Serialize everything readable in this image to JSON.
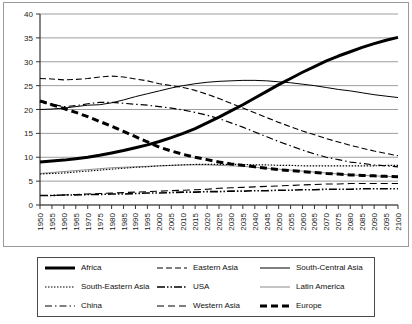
{
  "chart_data": {
    "type": "line",
    "title": "",
    "xlabel": "",
    "ylabel": "",
    "xlim": [
      1950,
      2100
    ],
    "ylim": [
      0,
      40
    ],
    "ytick_step": 5,
    "xtick_step": 5,
    "grid": true,
    "legend_position": "below",
    "yticks": [
      "0",
      "5",
      "10",
      "15",
      "20",
      "25",
      "30",
      "35",
      "40"
    ],
    "x": [
      1950,
      1955,
      1960,
      1965,
      1970,
      1975,
      1980,
      1985,
      1990,
      1995,
      2000,
      2005,
      2010,
      2015,
      2020,
      2025,
      2030,
      2035,
      2040,
      2045,
      2050,
      2055,
      2060,
      2065,
      2070,
      2075,
      2080,
      2085,
      2090,
      2095,
      2100
    ],
    "xtick_labels": [
      "1950",
      "1955",
      "1960",
      "1965",
      "1970",
      "1975",
      "1980",
      "1985",
      "1990",
      "1995",
      "2000",
      "2005",
      "2010",
      "2015",
      "2020",
      "2025",
      "2030",
      "2035",
      "2040",
      "2045",
      "2050",
      "2055",
      "2060",
      "2065",
      "2070",
      "2075",
      "2080",
      "2085",
      "2090",
      "2095",
      "2100"
    ],
    "series": [
      {
        "name": "Africa",
        "style": "solid-thick",
        "color": "#000000",
        "values": [
          9.0,
          9.2,
          9.4,
          9.7,
          10.0,
          10.4,
          10.9,
          11.4,
          12.0,
          12.6,
          13.3,
          14.1,
          15.0,
          16.0,
          17.2,
          18.4,
          19.7,
          21.0,
          22.4,
          23.8,
          25.2,
          26.5,
          27.8,
          29.0,
          30.2,
          31.2,
          32.1,
          33.0,
          33.8,
          34.5,
          35.1
        ]
      },
      {
        "name": "Eastern Asia",
        "style": "dashed",
        "color": "#000000",
        "values": [
          26.5,
          26.4,
          26.2,
          26.3,
          26.5,
          26.8,
          27.0,
          26.8,
          26.4,
          26.0,
          25.4,
          25.0,
          24.6,
          24.0,
          23.2,
          22.3,
          21.3,
          20.3,
          19.3,
          18.3,
          17.3,
          16.4,
          15.5,
          14.7,
          13.9,
          13.2,
          12.5,
          11.9,
          11.3,
          10.8,
          10.3
        ]
      },
      {
        "name": "South-Central Asia",
        "style": "solid-thin",
        "color": "#000000",
        "values": [
          20.0,
          20.1,
          20.3,
          20.6,
          20.9,
          21.0,
          21.4,
          22.0,
          22.7,
          23.3,
          23.9,
          24.5,
          25.0,
          25.4,
          25.7,
          25.9,
          26.0,
          26.1,
          26.1,
          26.0,
          25.8,
          25.6,
          25.3,
          25.0,
          24.6,
          24.2,
          23.9,
          23.5,
          23.1,
          22.8,
          22.5
        ]
      },
      {
        "name": "South-Eastern Asia",
        "style": "dotted",
        "color": "#000000",
        "values": [
          6.5,
          6.6,
          6.7,
          6.9,
          7.1,
          7.3,
          7.5,
          7.7,
          7.9,
          8.0,
          8.2,
          8.3,
          8.4,
          8.5,
          8.5,
          8.5,
          8.5,
          8.5,
          8.4,
          8.4,
          8.3,
          8.3,
          8.2,
          8.2,
          8.2,
          8.2,
          8.2,
          8.2,
          8.2,
          8.3,
          8.3
        ]
      },
      {
        "name": "USA",
        "style": "dash-dot-dot",
        "color": "#000000",
        "values": [
          2.0,
          2.0,
          2.1,
          2.1,
          2.2,
          2.2,
          2.3,
          2.3,
          2.4,
          2.5,
          2.5,
          2.6,
          2.7,
          2.7,
          2.8,
          2.8,
          2.9,
          2.9,
          3.0,
          3.0,
          3.1,
          3.1,
          3.2,
          3.2,
          3.3,
          3.3,
          3.3,
          3.4,
          3.4,
          3.4,
          3.4
        ]
      },
      {
        "name": "Latin America",
        "style": "solid-light",
        "color": "#8a8a8a",
        "values": [
          6.6,
          6.8,
          7.0,
          7.2,
          7.4,
          7.6,
          7.8,
          7.9,
          8.0,
          8.1,
          8.2,
          8.3,
          8.4,
          8.4,
          8.4,
          8.3,
          8.2,
          8.1,
          7.9,
          7.7,
          7.5,
          7.3,
          7.1,
          6.9,
          6.7,
          6.5,
          6.3,
          6.2,
          6.1,
          6.0,
          5.9
        ]
      },
      {
        "name": "China",
        "style": "dash-dot",
        "color": "#000000",
        "values": [
          21.6,
          21.1,
          20.6,
          20.8,
          21.2,
          21.5,
          21.5,
          21.3,
          21.1,
          20.9,
          20.6,
          20.3,
          19.9,
          19.4,
          18.8,
          18.1,
          17.2,
          16.3,
          15.3,
          14.3,
          13.3,
          12.4,
          11.5,
          10.7,
          10.0,
          9.5,
          9.0,
          8.7,
          8.4,
          8.2,
          8.0
        ]
      },
      {
        "name": "Western Asia",
        "style": "dash-long",
        "color": "#000000",
        "values": [
          2.0,
          2.0,
          2.1,
          2.2,
          2.3,
          2.4,
          2.5,
          2.6,
          2.7,
          2.8,
          2.9,
          3.0,
          3.1,
          3.2,
          3.3,
          3.5,
          3.6,
          3.7,
          3.8,
          3.9,
          4.0,
          4.1,
          4.2,
          4.3,
          4.4,
          4.4,
          4.5,
          4.5,
          4.5,
          4.5,
          4.5
        ]
      },
      {
        "name": "Europe",
        "style": "dashed-thick",
        "color": "#000000",
        "values": [
          21.8,
          21.0,
          20.2,
          19.4,
          18.5,
          17.5,
          16.5,
          15.4,
          14.3,
          13.2,
          12.1,
          11.3,
          10.6,
          10.0,
          9.5,
          9.0,
          8.6,
          8.3,
          8.0,
          7.7,
          7.4,
          7.2,
          7.0,
          6.8,
          6.6,
          6.5,
          6.3,
          6.2,
          6.1,
          6.0,
          5.9
        ]
      }
    ]
  },
  "legend": {
    "items": [
      {
        "label": "Africa",
        "swatch": "solid-thick"
      },
      {
        "label": "Eastern Asia",
        "swatch": "dashed"
      },
      {
        "label": "South-Central Asia",
        "swatch": "solid-thin"
      },
      {
        "label": "South-Eastern Asia",
        "swatch": "dotted"
      },
      {
        "label": "USA",
        "swatch": "dash-dot-dot"
      },
      {
        "label": "Latin America",
        "swatch": "solid-light"
      },
      {
        "label": "China",
        "swatch": "dash-dot"
      },
      {
        "label": "Western Asia",
        "swatch": "dash-long"
      },
      {
        "label": "Europe",
        "swatch": "dashed-thick"
      }
    ]
  }
}
